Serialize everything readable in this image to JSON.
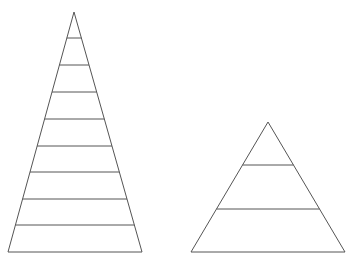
{
  "diagram": {
    "title": "",
    "stroke_color": "#555555",
    "background": "#ffffff",
    "pyramids": [
      {
        "name": "tall-pyramid",
        "apex": [
          74,
          12
        ],
        "base_left": [
          8,
          252
        ],
        "base_right": [
          142,
          252
        ],
        "layer_lines_y": [
          38,
          65,
          92,
          119,
          146,
          172,
          199,
          225
        ],
        "layer_count": 9
      },
      {
        "name": "short-pyramid",
        "apex": [
          268,
          122
        ],
        "base_left": [
          191,
          252
        ],
        "base_right": [
          345,
          252
        ],
        "layer_lines_y": [
          165,
          209
        ],
        "layer_count": 3
      }
    ]
  }
}
